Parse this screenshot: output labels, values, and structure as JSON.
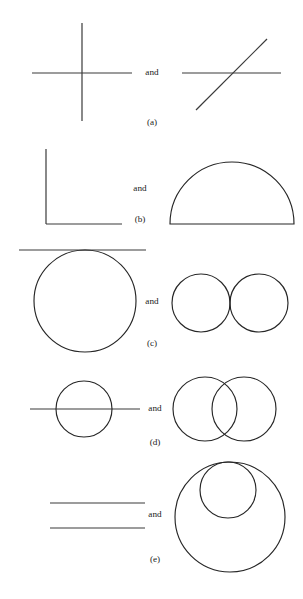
{
  "figure": {
    "conjunction_label": "and",
    "stroke_color": "#262626",
    "line_color": "#3a3a3a",
    "background_color": "#ffffff",
    "width": 303,
    "height": 599
  },
  "panels": [
    {
      "id": "a",
      "label": "(a)",
      "conjunction": "and",
      "label_x": 152,
      "label_y": 123,
      "conjunction_x": 152,
      "conjunction_y": 73,
      "left_shape_name": "cross-of-two-lines",
      "right_shape_name": "line-crossed-by-diagonal-line",
      "left": {
        "lines": [
          {
            "x1": 32,
            "y1": 73,
            "x2": 132,
            "y2": 73
          },
          {
            "x1": 82,
            "y1": 23,
            "x2": 82,
            "y2": 121
          }
        ]
      },
      "right": {
        "lines": [
          {
            "x1": 182,
            "y1": 73,
            "x2": 281,
            "y2": 73
          },
          {
            "x1": 196,
            "y1": 110,
            "x2": 267,
            "y2": 39
          }
        ]
      }
    },
    {
      "id": "b",
      "label": "(b)",
      "conjunction": "and",
      "label_x": 140,
      "label_y": 220,
      "conjunction_x": 140,
      "conjunction_y": 189,
      "left_shape_name": "right-angle-corner",
      "right_shape_name": "semicircle-with-chord",
      "left": {
        "lines": [
          {
            "x1": 46,
            "y1": 149,
            "x2": 46,
            "y2": 224
          },
          {
            "x1": 46,
            "y1": 224,
            "x2": 122,
            "y2": 224
          }
        ]
      },
      "right": {
        "semicircle": {
          "cx": 232,
          "cy": 224,
          "r": 62
        }
      }
    },
    {
      "id": "c",
      "label": "(c)",
      "conjunction": "and",
      "label_x": 152,
      "label_y": 344,
      "conjunction_x": 152,
      "conjunction_y": 302,
      "left_shape_name": "circle-tangent-to-line",
      "right_shape_name": "two-externally-tangent-circles",
      "left": {
        "lines": [
          {
            "x1": 19,
            "y1": 250,
            "x2": 146,
            "y2": 250
          }
        ],
        "circles": [
          {
            "cx": 85,
            "cy": 301,
            "r": 51
          }
        ]
      },
      "right": {
        "circles": [
          {
            "cx": 201,
            "cy": 303,
            "r": 29
          },
          {
            "cx": 259,
            "cy": 303,
            "r": 29
          }
        ]
      }
    },
    {
      "id": "d",
      "label": "(d)",
      "conjunction": "and",
      "label_x": 155,
      "label_y": 443,
      "conjunction_x": 155,
      "conjunction_y": 409,
      "left_shape_name": "line-through-circle",
      "right_shape_name": "two-overlapping-circles",
      "left": {
        "lines": [
          {
            "x1": 30,
            "y1": 409,
            "x2": 140,
            "y2": 409
          }
        ],
        "circles": [
          {
            "cx": 84,
            "cy": 409,
            "r": 28
          }
        ]
      },
      "right": {
        "circles": [
          {
            "cx": 205,
            "cy": 409,
            "r": 32
          },
          {
            "cx": 244,
            "cy": 409,
            "r": 32
          }
        ]
      }
    },
    {
      "id": "e",
      "label": "(e)",
      "conjunction": "and",
      "label_x": 155,
      "label_y": 560,
      "conjunction_x": 155,
      "conjunction_y": 515,
      "left_shape_name": "two-parallel-lines",
      "right_shape_name": "two-internally-tangent-circles",
      "left": {
        "lines": [
          {
            "x1": 50,
            "y1": 503,
            "x2": 145,
            "y2": 503
          },
          {
            "x1": 50,
            "y1": 528,
            "x2": 145,
            "y2": 528
          }
        ]
      },
      "right": {
        "circles": [
          {
            "cx": 230,
            "cy": 517,
            "r": 55
          },
          {
            "cx": 228,
            "cy": 490,
            "r": 28
          }
        ]
      }
    }
  ]
}
